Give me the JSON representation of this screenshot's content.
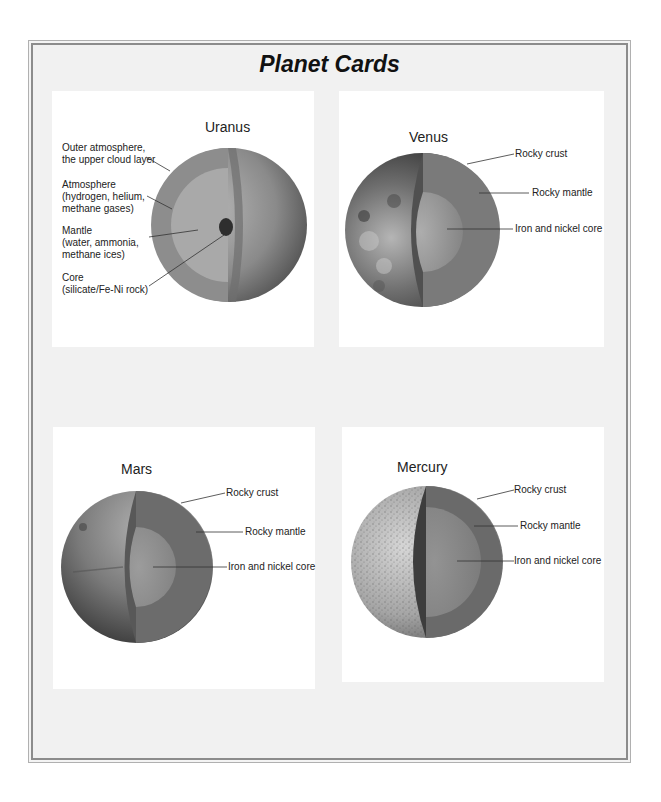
{
  "title": "Planet Cards",
  "cards": [
    {
      "planet": "Uranus",
      "labels": [
        {
          "line1": "Outer atmosphere,",
          "line2": "the upper cloud layer"
        },
        {
          "line1": "Atmosphere",
          "line2": "(hydrogen, helium,",
          "line3": "methane gases)"
        },
        {
          "line1": "Mantle",
          "line2": "(water, ammonia,",
          "line3": "methane ices)"
        },
        {
          "line1": "Core",
          "line2": "(silicate/Fe-Ni rock)"
        }
      ]
    },
    {
      "planet": "Venus",
      "labels": [
        {
          "line1": "Rocky crust"
        },
        {
          "line1": "Rocky mantle"
        },
        {
          "line1": "Iron and nickel core"
        }
      ]
    },
    {
      "planet": "Mars",
      "labels": [
        {
          "line1": "Rocky crust"
        },
        {
          "line1": "Rocky mantle"
        },
        {
          "line1": "Iron and nickel core"
        }
      ]
    },
    {
      "planet": "Mercury",
      "labels": [
        {
          "line1": "Rocky crust"
        },
        {
          "line1": "Rocky mantle"
        },
        {
          "line1": "Iron and nickel core"
        }
      ]
    }
  ]
}
